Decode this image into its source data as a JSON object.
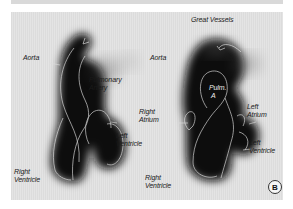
{
  "figure": {
    "panel_label": "B",
    "colors": {
      "background": "#e4e4e4",
      "silhouette": "#111111",
      "outline": "#e8e8e8",
      "text": "#1a1a1a"
    },
    "left_view": {
      "labels": {
        "aorta": "Aorta",
        "pulmonary_artery_line1": "Pulmonary",
        "pulmonary_artery_line2": "Artery",
        "left_ventricle_line1": "Left",
        "left_ventricle_line2": "Ventricle",
        "right_ventricle_line1": "Right",
        "right_ventricle_line2": "Ventricle"
      }
    },
    "right_view": {
      "labels": {
        "great_vessels": "Great Vessels",
        "aorta": "Aorta",
        "pulm_a_line1": "Pulm.",
        "pulm_a_line2": "A",
        "right_atrium_line1": "Right",
        "right_atrium_line2": "Atrium",
        "left_atrium_line1": "Left",
        "left_atrium_line2": "Atrium",
        "left_ventricle_line1": "Left",
        "left_ventricle_line2": "Ventricle",
        "right_ventricle_line1": "Right",
        "right_ventricle_line2": "Ventricle"
      }
    }
  }
}
